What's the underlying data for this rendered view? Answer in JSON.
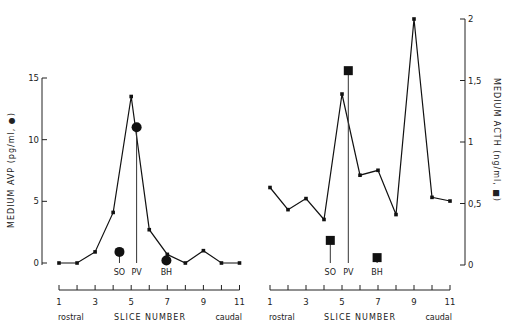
{
  "chart_data": [
    {
      "type": "line",
      "title": "",
      "xlabel": "SLICE NUMBER",
      "xlabel_left": "rostral",
      "xlabel_right": "caudal",
      "ylabel": "MEDIUM AVP (pg/ml, ●)",
      "ylim": [
        0,
        15
      ],
      "yticks": [
        "0",
        "5",
        "10",
        "15"
      ],
      "xticks": [
        "1",
        "3",
        "5",
        "7",
        "9",
        "11"
      ],
      "x": [
        1,
        2,
        3,
        4,
        5,
        6,
        7,
        8,
        9,
        10,
        11
      ],
      "series": [
        {
          "name": "AVP slices",
          "values": [
            0,
            0,
            0.9,
            4.1,
            13.5,
            2.7,
            0.7,
            0,
            1.0,
            0,
            0
          ]
        }
      ],
      "markers": [
        {
          "label": "SO",
          "x": 4.35,
          "value": 0.9,
          "shape": "circle"
        },
        {
          "label": "PV",
          "x": 5.3,
          "value": 11.0,
          "shape": "circle"
        },
        {
          "label": "BH",
          "x": 6.95,
          "value": 0.2,
          "shape": "circle"
        }
      ],
      "axis_side": "left"
    },
    {
      "type": "line",
      "title": "",
      "xlabel": "SLICE NUMBER",
      "xlabel_left": "rostral",
      "xlabel_right": "caudal",
      "ylabel": "MEDIUM ACTH (ng/ml, ■)",
      "ylim": [
        0,
        2
      ],
      "yticks": [
        "0",
        "0,5",
        "1",
        "1,5",
        "2"
      ],
      "xticks": [
        "1",
        "3",
        "5",
        "7",
        "9",
        "11"
      ],
      "x": [
        1,
        2,
        3,
        4,
        5,
        6,
        7,
        8,
        9,
        10,
        11
      ],
      "series": [
        {
          "name": "ACTH slices",
          "values": [
            0.63,
            0.45,
            0.54,
            0.37,
            1.39,
            0.73,
            0.77,
            0.41,
            2.0,
            0.55,
            0.52
          ]
        }
      ],
      "markers": [
        {
          "label": "SO",
          "x": 4.35,
          "value": 0.2,
          "shape": "square"
        },
        {
          "label": "PV",
          "x": 5.35,
          "value": 1.58,
          "shape": "square"
        },
        {
          "label": "BH",
          "x": 6.95,
          "value": 0.06,
          "shape": "square"
        }
      ],
      "axis_side": "right"
    }
  ]
}
